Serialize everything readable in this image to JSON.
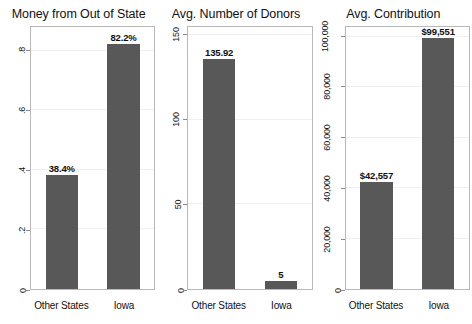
{
  "figure": {
    "background_color": "#ffffff",
    "bar_color": "#585858",
    "frame_color": "#b9b9b9",
    "grid_color": "#f0f0f0"
  },
  "chart_data": [
    {
      "type": "bar",
      "title": "Money from Out of State",
      "xlabel": "",
      "ylabel": "",
      "categories": [
        "Other States",
        "Iowa"
      ],
      "values": [
        0.384,
        0.822
      ],
      "value_labels": [
        "38.4%",
        "82.2%"
      ],
      "ylim": [
        0,
        0.88
      ],
      "yticks": [
        0.8,
        0.6,
        0.4,
        0.2,
        0
      ],
      "ytick_labels": [
        ".8",
        ".6",
        ".4",
        ".2",
        "0"
      ],
      "grid": true,
      "legend": "none"
    },
    {
      "type": "bar",
      "title": "Avg. Number of Donors",
      "xlabel": "",
      "ylabel": "",
      "categories": [
        "Other States",
        "Iowa"
      ],
      "values": [
        135.92,
        5
      ],
      "value_labels": [
        "135.92",
        "5"
      ],
      "ylim": [
        0,
        155
      ],
      "yticks": [
        150,
        100,
        50,
        0
      ],
      "ytick_labels": [
        "150",
        "100",
        "50",
        "0"
      ],
      "grid": true,
      "legend": "none"
    },
    {
      "type": "bar",
      "title": "Avg. Contribution",
      "xlabel": "",
      "ylabel": "",
      "categories": [
        "Other States",
        "Iowa"
      ],
      "values": [
        42557,
        99551
      ],
      "value_labels": [
        "$42,557",
        "$99,551"
      ],
      "ylim": [
        0,
        104000
      ],
      "yticks": [
        100000,
        80000,
        60000,
        40000,
        20000,
        0
      ],
      "ytick_labels": [
        "100,000",
        "80,000",
        "60,000",
        "40,000",
        "20,000",
        "0"
      ],
      "grid": true,
      "legend": "none"
    }
  ]
}
